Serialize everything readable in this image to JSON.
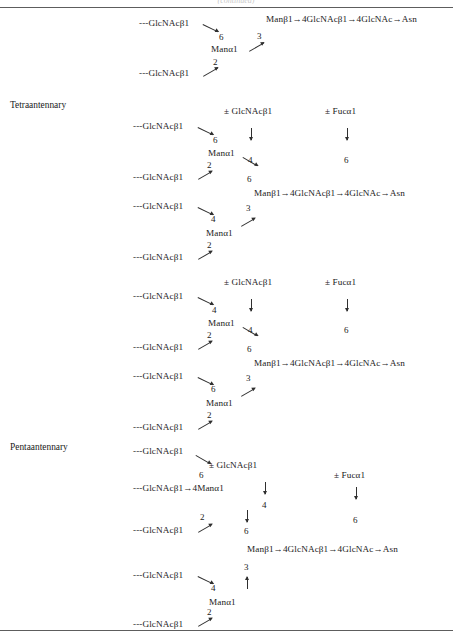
{
  "figure": {
    "clipped_header": "(continued)",
    "background_color": "#ffffff",
    "rule_color": "#5d5d5d"
  },
  "glyph": {
    "dash_glcnac_b1": "---GlcNAcβ1",
    "man_a1": "Manα1",
    "pm_glcnac_b1": "± GlcNAcβ1",
    "pm_fuc_a1": "± Fucα1",
    "core_chain": "Manβ1→4GlcNAcβ1→4GlcNAc→Asn",
    "glcnac_b1_to_4man_a1": "---GlcNAcβ1→4Manα1",
    "down_arrow": "↓",
    "up_arrow": "↑",
    "n2": "2",
    "n3": "3",
    "n4": "4",
    "n6": "6"
  },
  "structures": [
    {
      "id": "triantennary-continued",
      "name_label": "",
      "antennae": [
        {
          "residue": "---GlcNAcβ1",
          "linkage": "6"
        },
        {
          "residue": "---GlcNAcβ1",
          "linkage": "2"
        }
      ],
      "branch_man": "Manα1",
      "branch_linkage": "3",
      "core": "Manβ1→4GlcNAcβ1→4GlcNAc→Asn",
      "bisecting_glcnac": "",
      "core_fucose": ""
    },
    {
      "id": "tetraantennary-a",
      "name_label": "Tetraantennary",
      "bisecting_glcnac": "± GlcNAcβ1",
      "bisecting_linkage": "4",
      "core_fucose": "± Fucα1",
      "core_fucose_linkage": "6",
      "upper_arm": {
        "man": "Manα1",
        "to_core_linkage": "6",
        "antennae": [
          {
            "residue": "---GlcNAcβ1",
            "linkage": "6"
          },
          {
            "residue": "---GlcNAcβ1",
            "linkage": "2"
          }
        ]
      },
      "lower_arm": {
        "man": "Manα1",
        "to_core_linkage": "3",
        "antennae": [
          {
            "residue": "---GlcNAcβ1",
            "linkage": "4"
          },
          {
            "residue": "---GlcNAcβ1",
            "linkage": "2"
          }
        ]
      },
      "core": "Manβ1→4GlcNAcβ1→4GlcNAc→Asn"
    },
    {
      "id": "tetraantennary-b",
      "name_label": "",
      "bisecting_glcnac": "± GlcNAcβ1",
      "bisecting_linkage": "4",
      "core_fucose": "± Fucα1",
      "core_fucose_linkage": "6",
      "upper_arm": {
        "man": "Manα1",
        "to_core_linkage": "6",
        "antennae": [
          {
            "residue": "---GlcNAcβ1",
            "linkage": "4"
          },
          {
            "residue": "---GlcNAcβ1",
            "linkage": "2"
          }
        ]
      },
      "lower_arm": {
        "man": "Manα1",
        "to_core_linkage": "3",
        "antennae": [
          {
            "residue": "---GlcNAcβ1",
            "linkage": "6"
          },
          {
            "residue": "---GlcNAcβ1",
            "linkage": "2"
          }
        ]
      },
      "core": "Manβ1→4GlcNAcβ1→4GlcNAc→Asn"
    },
    {
      "id": "pentaantennary",
      "name_label": "Pentaantennary",
      "bisecting_glcnac": "± GlcNAcβ1",
      "bisecting_linkage": "4",
      "core_fucose": "± Fucα1",
      "core_fucose_linkage": "6",
      "upper_arm": {
        "man_with_linkage": "---GlcNAcβ1→4Manα1",
        "to_core_linkage": "6",
        "antennae": [
          {
            "residue": "---GlcNAcβ1",
            "linkage": "6"
          },
          {
            "residue": "---GlcNAcβ1",
            "linkage": "2"
          }
        ]
      },
      "lower_arm": {
        "man": "Manα1",
        "to_core_linkage": "3",
        "antennae": [
          {
            "residue": "---GlcNAcβ1",
            "linkage": "4"
          },
          {
            "residue": "---GlcNAcβ1",
            "linkage": "2"
          }
        ]
      },
      "core": "Manβ1→4GlcNAcβ1→4GlcNAc→Asn"
    }
  ]
}
